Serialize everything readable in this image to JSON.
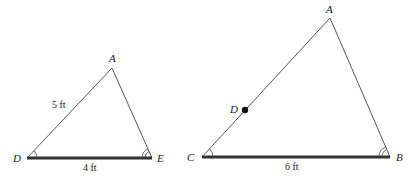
{
  "diagram": {
    "type": "similar-triangles",
    "triangles": [
      {
        "name": "triangle-ADE",
        "vertices": {
          "A": {
            "label": "A",
            "x": 112,
            "y": 68
          },
          "D": {
            "label": "D",
            "x": 27,
            "y": 158
          },
          "E": {
            "label": "E",
            "x": 152,
            "y": 158
          }
        },
        "side_labels": {
          "DA": "5 ft",
          "DE": "4 ft"
        },
        "angle_marks": {
          "D": "single-arc",
          "E": "double-arc"
        },
        "thick_side": "DE"
      },
      {
        "name": "triangle-ACB",
        "vertices": {
          "A": {
            "label": "A",
            "x": 330,
            "y": 18
          },
          "C": {
            "label": "C",
            "x": 202,
            "y": 157
          },
          "B": {
            "label": "B",
            "x": 390,
            "y": 157
          }
        },
        "point_on_side": {
          "label": "D",
          "on": "CA",
          "x": 245,
          "y": 110
        },
        "side_labels": {
          "CB": "6 ft"
        },
        "angle_marks": {
          "C": "single-arc",
          "B": "double-arc"
        },
        "thick_side": "CB"
      }
    ]
  },
  "labels": {
    "left_A": "A",
    "left_D": "D",
    "left_E": "E",
    "left_DA": "5 ft",
    "left_DE": "4 ft",
    "right_A": "A",
    "right_C": "C",
    "right_B": "B",
    "right_D": "D",
    "right_CB": "6 ft"
  }
}
